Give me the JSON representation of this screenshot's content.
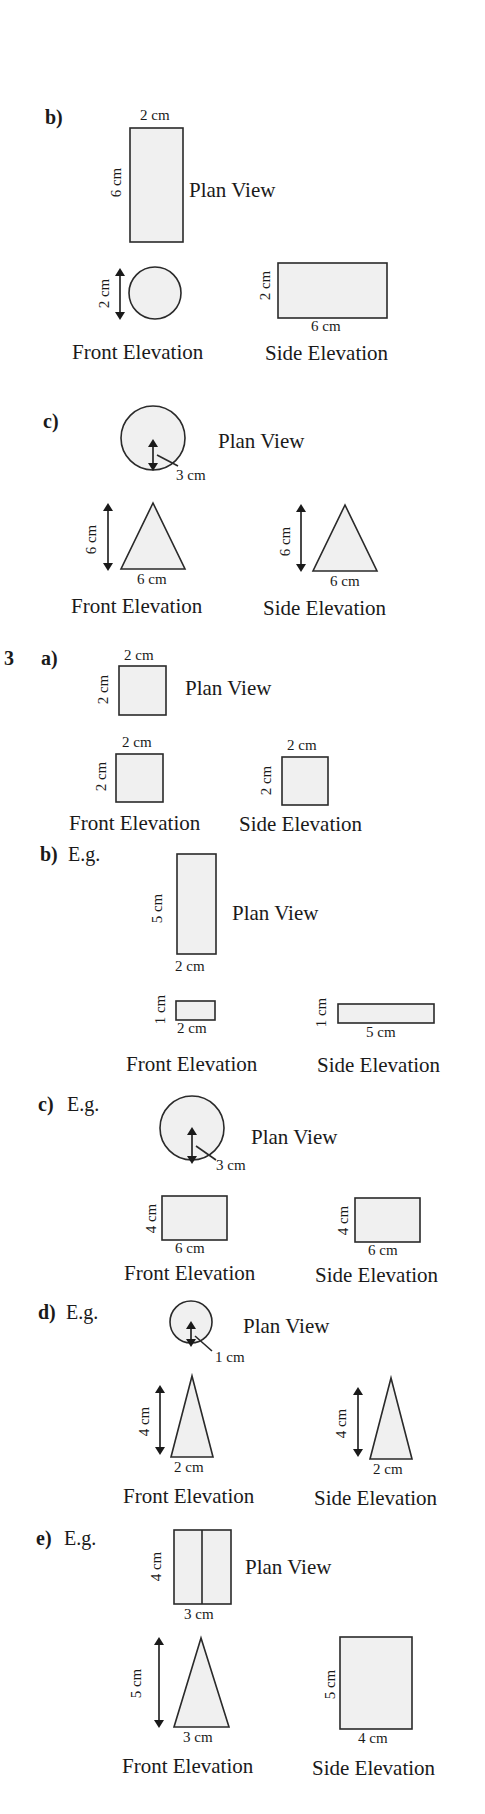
{
  "document": {
    "type": "textbook answer page — plans and elevations",
    "labels": {
      "plan": "Plan View",
      "front": "Front Elevation",
      "side": "Side Elevation",
      "eg": "E.g."
    }
  },
  "question2": {
    "parts": [
      {
        "part": "b)",
        "plan": {
          "shape": "rectangle",
          "width": "2 cm",
          "height": "6 cm"
        },
        "front": {
          "shape": "circle",
          "diameter": "2 cm"
        },
        "side": {
          "shape": "rectangle",
          "width": "6 cm",
          "height": "2 cm"
        }
      },
      {
        "part": "c)",
        "plan": {
          "shape": "circle",
          "radius": "3 cm"
        },
        "front": {
          "shape": "triangle",
          "base": "6 cm",
          "height": "6 cm"
        },
        "side": {
          "shape": "triangle",
          "base": "6 cm",
          "height": "6 cm"
        }
      }
    ]
  },
  "question3": {
    "number": "3",
    "parts": [
      {
        "part": "a)",
        "plan": {
          "shape": "square",
          "width": "2 cm",
          "height": "2 cm"
        },
        "front": {
          "shape": "square",
          "width": "2 cm",
          "height": "2 cm"
        },
        "side": {
          "shape": "square",
          "width": "2 cm",
          "height": "2 cm"
        }
      },
      {
        "part": "b)",
        "prefix": "E.g.",
        "plan": {
          "shape": "rectangle",
          "width": "2 cm",
          "height": "5 cm"
        },
        "front": {
          "shape": "rectangle",
          "width": "2 cm",
          "height": "1 cm"
        },
        "side": {
          "shape": "rectangle",
          "width": "5 cm",
          "height": "1 cm"
        }
      },
      {
        "part": "c)",
        "prefix": "E.g.",
        "plan": {
          "shape": "circle",
          "radius": "3 cm"
        },
        "front": {
          "shape": "rectangle",
          "width": "6 cm",
          "height": "4 cm"
        },
        "side": {
          "shape": "rectangle",
          "width": "6 cm",
          "height": "4 cm"
        }
      },
      {
        "part": "d)",
        "prefix": "E.g.",
        "plan": {
          "shape": "circle",
          "radius": "1 cm"
        },
        "front": {
          "shape": "triangle",
          "base": "2 cm",
          "height": "4 cm"
        },
        "side": {
          "shape": "triangle",
          "base": "2 cm",
          "height": "4 cm"
        }
      },
      {
        "part": "e)",
        "prefix": "E.g.",
        "plan": {
          "shape": "split rectangle",
          "width": "3 cm",
          "height": "4 cm"
        },
        "front": {
          "shape": "triangle",
          "base": "3 cm",
          "height": "5 cm"
        },
        "side": {
          "shape": "rectangle",
          "width": "4 cm",
          "height": "5 cm"
        }
      }
    ]
  },
  "colors": {
    "shape_fill": "#f0f0f0",
    "stroke": "#2a2a2a",
    "text": "#1a1a1a",
    "background": "#ffffff"
  }
}
